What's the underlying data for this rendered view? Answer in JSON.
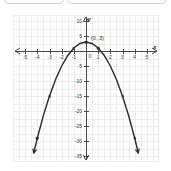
{
  "top_choices": [
    {
      "label": ""
    },
    {
      "label": ""
    }
  ],
  "chart_data": {
    "type": "line",
    "title": "",
    "xlabel": "x",
    "ylabel": "y",
    "xlim": [
      -6,
      6
    ],
    "ylim": [
      -37,
      12
    ],
    "grid": true,
    "legend": "none",
    "equation": "y = -2x^2 + 3",
    "x_ticks": [
      -5,
      -4,
      -3,
      -2,
      -1,
      0,
      1,
      2,
      3,
      4,
      5
    ],
    "x_tick_labels": [
      "-5",
      "-4",
      "-3",
      "-2",
      "-1",
      "0",
      "1",
      "2",
      "3",
      "4",
      "5"
    ],
    "y_ticks": [
      10,
      5,
      -5,
      -10,
      -15,
      -20,
      -25,
      -30,
      -35
    ],
    "y_tick_labels": [
      "10",
      "5",
      "-5",
      "-10",
      "-15",
      "-20",
      "-25",
      "-30",
      "-35"
    ],
    "origin_label": "0",
    "series": [
      {
        "name": "parabola",
        "color": "#2b2b2b",
        "x": [
          -4.3,
          -4,
          -3.5,
          -3,
          -2.5,
          -2,
          -1.5,
          -1,
          -0.5,
          0,
          0.5,
          1,
          1.5,
          2,
          2.5,
          3,
          3.5,
          4,
          4.3
        ],
        "y": [
          -34.0,
          -29,
          -21.5,
          -15,
          -9.5,
          -5,
          -1.5,
          1,
          2.5,
          3,
          2.5,
          1,
          -1.5,
          -5,
          -9.5,
          -15,
          -21.5,
          -29,
          -34.0
        ]
      }
    ],
    "marked_points": [
      {
        "x": -4,
        "y": -29
      },
      {
        "x": -3,
        "y": -15
      },
      {
        "x": -1,
        "y": 1
      },
      {
        "x": 0,
        "y": 3
      },
      {
        "x": 1,
        "y": 1
      },
      {
        "x": 3,
        "y": -15
      },
      {
        "x": 4,
        "y": -29
      }
    ],
    "annotations": [
      {
        "text": "(0, 3)",
        "x": 0,
        "y": 3
      }
    ]
  }
}
